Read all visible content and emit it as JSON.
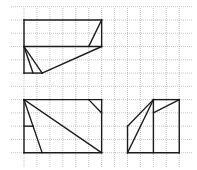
{
  "diagram": {
    "type": "grid-geometry-figures",
    "grid": {
      "origin_px": [
        24,
        20
      ],
      "cell_px": [
        12.94,
        13.27
      ],
      "h_lines": {
        "x_from_px": 11,
        "x_to_px": 192,
        "rows": [
          -1,
          0,
          1,
          2,
          3,
          4,
          5,
          6,
          7,
          8,
          9,
          10
        ]
      },
      "v_lines": {
        "y_from_px": 8,
        "y_to_px": 167,
        "cols": [
          0,
          1,
          2,
          3,
          4,
          5,
          6,
          7,
          8,
          9,
          10,
          11,
          12
        ]
      },
      "line_color": "#9a9a9a",
      "style": "dotted"
    },
    "stroke_color": "#1c1c1c",
    "figures": [
      {
        "name": "top-figure",
        "segments": [
          [
            [
              0,
              0
            ],
            [
              6,
              0
            ]
          ],
          [
            [
              6,
              0
            ],
            [
              6,
              2
            ]
          ],
          [
            [
              6,
              2
            ],
            [
              0,
              2
            ]
          ],
          [
            [
              0,
              2
            ],
            [
              0,
              0
            ]
          ],
          [
            [
              6,
              0
            ],
            [
              5,
              2
            ]
          ],
          [
            [
              0,
              2
            ],
            [
              0,
              4
            ]
          ],
          [
            [
              0,
              4
            ],
            [
              1.4,
              4
            ]
          ],
          [
            [
              1.4,
              4
            ],
            [
              6,
              2
            ]
          ],
          [
            [
              0,
              2
            ],
            [
              0.7,
              4
            ]
          ],
          [
            [
              0,
              2
            ],
            [
              1.4,
              4
            ]
          ]
        ]
      },
      {
        "name": "bottom-left-figure",
        "segments": [
          [
            [
              0,
              6
            ],
            [
              6,
              6
            ]
          ],
          [
            [
              6,
              6
            ],
            [
              6,
              10
            ]
          ],
          [
            [
              6,
              10
            ],
            [
              0,
              10
            ]
          ],
          [
            [
              0,
              10
            ],
            [
              0,
              6
            ]
          ],
          [
            [
              0,
              6
            ],
            [
              6,
              10
            ]
          ],
          [
            [
              0,
              6
            ],
            [
              1.4,
              10
            ]
          ],
          [
            [
              0,
              8
            ],
            [
              0.7,
              8
            ]
          ],
          [
            [
              5,
              6
            ],
            [
              6,
              7
            ]
          ]
        ]
      },
      {
        "name": "bottom-right-figure",
        "segments": [
          [
            [
              8,
              10
            ],
            [
              8,
              8
            ]
          ],
          [
            [
              8,
              8
            ],
            [
              10,
              6
            ]
          ],
          [
            [
              10,
              6
            ],
            [
              12,
              6
            ]
          ],
          [
            [
              12,
              6
            ],
            [
              12,
              10
            ]
          ],
          [
            [
              12,
              10
            ],
            [
              8,
              10
            ]
          ],
          [
            [
              10,
              6
            ],
            [
              10,
              10
            ]
          ],
          [
            [
              8,
              10
            ],
            [
              10,
              6
            ]
          ],
          [
            [
              10,
              7
            ],
            [
              12,
              6
            ]
          ]
        ]
      }
    ]
  }
}
